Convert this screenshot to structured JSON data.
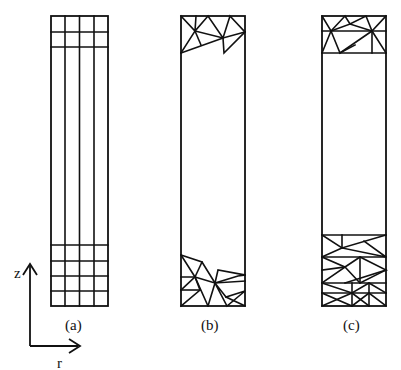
{
  "figure": {
    "panels": [
      {
        "id": "a",
        "label": "(a)",
        "description": "structured quadrilateral grid with 4 radial columns, refined rows at top and bottom"
      },
      {
        "id": "b",
        "label": "(b)",
        "description": "unstructured triangular mesh at top and bottom ends only"
      },
      {
        "id": "c",
        "label": "(c)",
        "description": "triangular mesh in layered bands at top and bottom"
      }
    ],
    "axes": {
      "vertical_label": "z",
      "horizontal_label": "r"
    }
  }
}
